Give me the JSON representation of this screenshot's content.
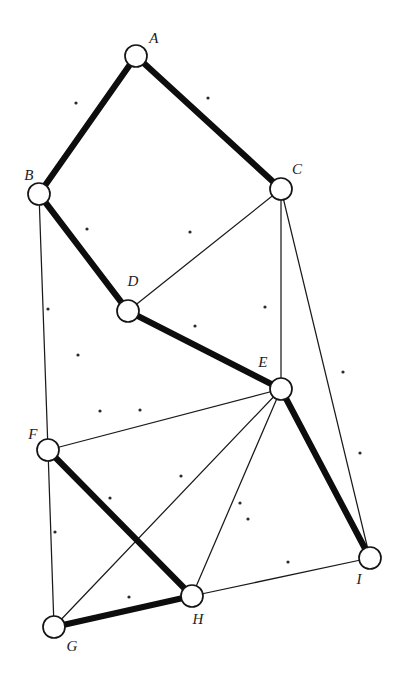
{
  "figure": {
    "kind": "undirected-graph-drawing",
    "title": "",
    "width": 405,
    "height": 684,
    "background_color": "#ffffff",
    "ink_color": "#141414",
    "vertex_fill_color": "#ffffff",
    "vertex_radius": 11,
    "thin_edge_width": 1.25,
    "thick_edge_width": 6.2,
    "speck_color": "#2a2a2a"
  },
  "chart_data": {
    "type": "graph",
    "title": "",
    "xlabel": "",
    "ylabel": "",
    "vertex_count": 9,
    "edge_count": 16,
    "thick_edge_count": 7,
    "thin_edge_count": 9,
    "vertices": [
      {
        "id": "A",
        "label": "A",
        "x": 136,
        "y": 56,
        "label_x": 154,
        "label_y": 38,
        "degree": 2
      },
      {
        "id": "B",
        "label": "B",
        "x": 39,
        "y": 194,
        "label_x": 29,
        "label_y": 175,
        "degree": 3
      },
      {
        "id": "C",
        "label": "C",
        "x": 281,
        "y": 189,
        "label_x": 297,
        "label_y": 169,
        "degree": 4
      },
      {
        "id": "D",
        "label": "D",
        "x": 128,
        "y": 311,
        "label_x": 133,
        "label_y": 281,
        "degree": 3
      },
      {
        "id": "E",
        "label": "E",
        "x": 281,
        "y": 389,
        "label_x": 263,
        "label_y": 362,
        "degree": 6
      },
      {
        "id": "F",
        "label": "F",
        "x": 48,
        "y": 450,
        "label_x": 33,
        "label_y": 434,
        "degree": 4
      },
      {
        "id": "G",
        "label": "G",
        "x": 54,
        "y": 627,
        "label_x": 72,
        "label_y": 646,
        "degree": 3
      },
      {
        "id": "H",
        "label": "H",
        "x": 192,
        "y": 596,
        "label_x": 198,
        "label_y": 619,
        "degree": 4
      },
      {
        "id": "I",
        "label": "I",
        "x": 370,
        "y": 558,
        "label_x": 359,
        "label_y": 579,
        "degree": 3
      }
    ],
    "edges": [
      {
        "from": "A",
        "to": "B",
        "weight_style": "thick"
      },
      {
        "from": "A",
        "to": "C",
        "weight_style": "thick"
      },
      {
        "from": "B",
        "to": "D",
        "weight_style": "thick"
      },
      {
        "from": "B",
        "to": "F",
        "weight_style": "thin"
      },
      {
        "from": "C",
        "to": "D",
        "weight_style": "thin"
      },
      {
        "from": "C",
        "to": "E",
        "weight_style": "thin"
      },
      {
        "from": "C",
        "to": "I",
        "weight_style": "thin"
      },
      {
        "from": "D",
        "to": "E",
        "weight_style": "thick"
      },
      {
        "from": "E",
        "to": "F",
        "weight_style": "thin"
      },
      {
        "from": "E",
        "to": "G",
        "weight_style": "thin"
      },
      {
        "from": "E",
        "to": "H",
        "weight_style": "thin"
      },
      {
        "from": "E",
        "to": "I",
        "weight_style": "thick"
      },
      {
        "from": "F",
        "to": "G",
        "weight_style": "thin"
      },
      {
        "from": "F",
        "to": "H",
        "weight_style": "thick"
      },
      {
        "from": "G",
        "to": "H",
        "weight_style": "thick"
      },
      {
        "from": "H",
        "to": "I",
        "weight_style": "thin"
      }
    ],
    "specks": [
      {
        "x": 76,
        "y": 103
      },
      {
        "x": 208,
        "y": 98
      },
      {
        "x": 87,
        "y": 229
      },
      {
        "x": 190,
        "y": 232
      },
      {
        "x": 48,
        "y": 309
      },
      {
        "x": 265,
        "y": 307
      },
      {
        "x": 195,
        "y": 326
      },
      {
        "x": 78,
        "y": 355
      },
      {
        "x": 343,
        "y": 372
      },
      {
        "x": 140,
        "y": 410
      },
      {
        "x": 100,
        "y": 411
      },
      {
        "x": 181,
        "y": 476
      },
      {
        "x": 110,
        "y": 498
      },
      {
        "x": 240,
        "y": 503
      },
      {
        "x": 55,
        "y": 532
      },
      {
        "x": 360,
        "y": 453
      },
      {
        "x": 288,
        "y": 562
      },
      {
        "x": 129,
        "y": 597
      },
      {
        "x": 248,
        "y": 519
      }
    ]
  }
}
